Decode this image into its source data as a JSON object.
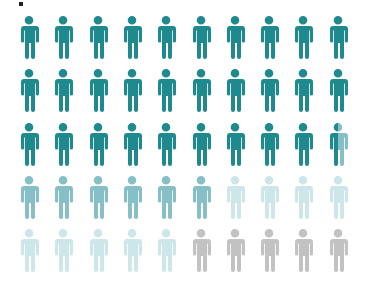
{
  "chart_data": {
    "type": "pictograph",
    "title": "",
    "columns": 10,
    "rows": 5,
    "total_icons": 50,
    "icon": "person-icon",
    "series": [
      {
        "name": "Category 1",
        "value": 29.5,
        "color": "#1f8a8e"
      },
      {
        "name": "Category 2",
        "value": 6.5,
        "color": "#86bfc6"
      },
      {
        "name": "Category 3",
        "value": 9,
        "color": "#cce6ea"
      },
      {
        "name": "Category 4",
        "value": 5,
        "color": "#c2c2c2"
      }
    ],
    "legend": "none",
    "grid": false
  },
  "layout": {
    "col_start_x": 0,
    "col_spacing": 34.3,
    "row_start_y": 0,
    "row_spacing": 53.3
  }
}
